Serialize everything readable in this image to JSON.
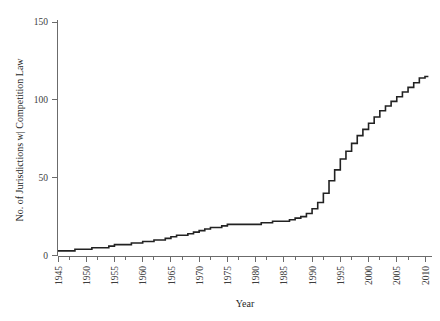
{
  "chart_data": {
    "type": "line",
    "subtype": "step",
    "title": "",
    "xlabel": "Year",
    "ylabel": "No. of Jurisdictions w| Competition Law",
    "xlim": [
      1945,
      2010
    ],
    "ylim": [
      0,
      150
    ],
    "grid": false,
    "legend": null,
    "x_ticks": [
      1945,
      1950,
      1955,
      1960,
      1965,
      1970,
      1975,
      1980,
      1985,
      1990,
      1995,
      2000,
      2005,
      2010
    ],
    "x_tick_labels": [
      "1945",
      "1950",
      "1955",
      "1960",
      "1965",
      "1970",
      "1975",
      "1980",
      "1985",
      "1990",
      "1995",
      "2000",
      "2005",
      "2010"
    ],
    "x_minor_ticks": [
      1947,
      1952,
      1957,
      1962,
      1967,
      1972,
      1977,
      1982,
      1987,
      1992,
      1997,
      2002,
      2007
    ],
    "y_ticks": [
      0,
      50,
      100,
      150
    ],
    "y_tick_labels": [
      "0",
      "50",
      "100",
      "150"
    ],
    "line_color": "#222222",
    "axis_color": "#6b6b6b",
    "x": [
      1945,
      1946,
      1947,
      1948,
      1949,
      1950,
      1951,
      1952,
      1953,
      1954,
      1955,
      1956,
      1957,
      1958,
      1959,
      1960,
      1961,
      1962,
      1963,
      1964,
      1965,
      1966,
      1967,
      1968,
      1969,
      1970,
      1971,
      1972,
      1973,
      1974,
      1975,
      1976,
      1977,
      1978,
      1979,
      1980,
      1981,
      1982,
      1983,
      1984,
      1985,
      1986,
      1987,
      1988,
      1989,
      1990,
      1991,
      1992,
      1993,
      1994,
      1995,
      1996,
      1997,
      1998,
      1999,
      2000,
      2001,
      2002,
      2003,
      2004,
      2005,
      2006,
      2007,
      2008,
      2009,
      2010
    ],
    "values": [
      3,
      3,
      3,
      4,
      4,
      4,
      5,
      5,
      5,
      6,
      7,
      7,
      7,
      8,
      8,
      9,
      9,
      10,
      10,
      11,
      12,
      13,
      13,
      14,
      15,
      16,
      17,
      18,
      18,
      19,
      20,
      20,
      20,
      20,
      20,
      20,
      21,
      21,
      22,
      22,
      22,
      23,
      24,
      25,
      27,
      30,
      34,
      40,
      48,
      55,
      62,
      67,
      72,
      77,
      81,
      85,
      89,
      93,
      96,
      99,
      102,
      105,
      108,
      111,
      114,
      115
    ],
    "series_name": "Cumulative jurisdictions with competition law",
    "annotations": []
  }
}
